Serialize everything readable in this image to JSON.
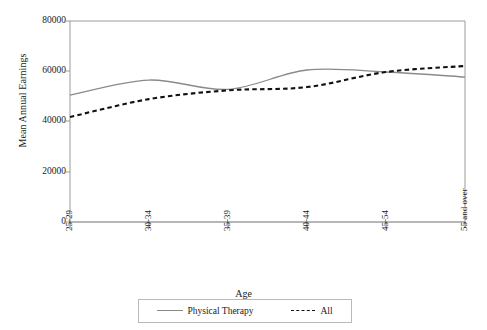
{
  "chart_data": {
    "type": "line",
    "title": "",
    "xlabel": "Age",
    "ylabel": "Mean Annual Earnings",
    "categories": [
      "25-29",
      "30-34",
      "35-39",
      "40-44",
      "45-54",
      "55 and over"
    ],
    "yticks": [
      0,
      20000,
      40000,
      60000,
      80000
    ],
    "ytick_labels": [
      "0",
      "20000",
      "40000",
      "60000",
      "80000"
    ],
    "ylim": [
      0,
      80000
    ],
    "grid": false,
    "legend_position": "bottom-center",
    "series": [
      {
        "name": "Physical Therapy",
        "style": "solid",
        "color": "#8a8a8a",
        "values": [
          50500,
          56500,
          52800,
          60500,
          59700,
          57700
        ]
      },
      {
        "name": "All",
        "style": "dotted",
        "color": "#111111",
        "values": [
          41800,
          48900,
          52400,
          53700,
          59700,
          62100
        ]
      }
    ]
  },
  "axes": {
    "xlabel": "Age",
    "ylabel": "Mean Annual Earnings"
  },
  "legend": {
    "items": [
      {
        "label": "Physical Therapy",
        "style": "solid"
      },
      {
        "label": "All",
        "style": "dotted"
      }
    ]
  }
}
